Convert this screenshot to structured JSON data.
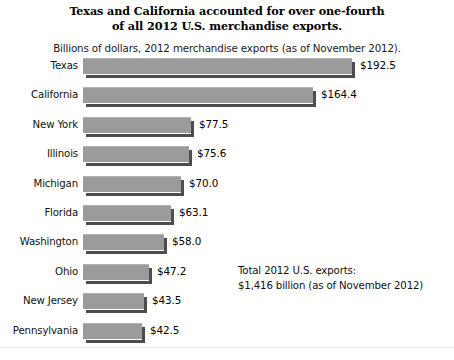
{
  "chart_data": {
    "type": "bar",
    "orientation": "horizontal",
    "title": "Texas and California accounted for over one-fourth of all 2012 U.S. merchandise exports.",
    "title_line1": "Texas and California accounted for over one-fourth",
    "title_line2": "of all 2012 U.S. merchandise exports.",
    "subtitle": "Billions of dollars, 2012 merchandise exports (as of November 2012).",
    "xlabel": "",
    "ylabel": "",
    "xlim": [
      0,
      200
    ],
    "grid": false,
    "legend": "none",
    "categories": [
      "Texas",
      "California",
      "New York",
      "Illinois",
      "Michigan",
      "Florida",
      "Washington",
      "Ohio",
      "New Jersey",
      "Pennsylvania"
    ],
    "values": [
      192.5,
      164.4,
      77.5,
      75.6,
      70.0,
      63.1,
      58.0,
      47.2,
      43.5,
      42.5
    ],
    "value_labels": [
      "$192.5",
      "$164.4",
      "$77.5",
      "$75.6",
      "$70.0",
      "$63.1",
      "$58.0",
      "$47.2",
      "$43.5",
      "$42.5"
    ],
    "annotations": [
      "Total 2012 U.S. exports:",
      "$1,416 billion (as of November 2012)"
    ],
    "bar_color": "#9b9b9b",
    "bar_shadow_color": "#4d4d4d",
    "bar_highlight_color": "#b4b4b4",
    "background_color": "#ffffff",
    "text_color": "#111111"
  },
  "annotation": {
    "line1": "Total 2012 U.S. exports:",
    "line2": "$1,416 billion (as of November 2012)"
  }
}
